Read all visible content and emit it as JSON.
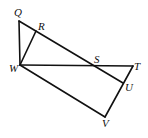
{
  "diagram": {
    "points": {
      "Q": {
        "label": "Q",
        "x": 19,
        "y": 21
      },
      "R": {
        "label": "R",
        "x": 36,
        "y": 31
      },
      "S": {
        "label": "S",
        "x": 91,
        "y": 66
      },
      "T": {
        "label": "T",
        "x": 133,
        "y": 66
      },
      "U": {
        "label": "U",
        "x": 123,
        "y": 83
      },
      "V": {
        "label": "V",
        "x": 105,
        "y": 117
      },
      "W": {
        "label": "W",
        "x": 20,
        "y": 65
      }
    },
    "segments": [
      "QW",
      "QU",
      "WR",
      "WT",
      "TV",
      "WV"
    ],
    "stroke_color": "#111111",
    "background_color": "#ffffff"
  }
}
